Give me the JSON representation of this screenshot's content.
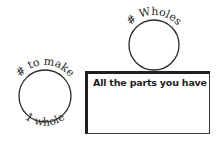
{
  "diagram": {
    "left_circle": {
      "top_label": "# to make",
      "bottom_label": "1 whole"
    },
    "top_circle": {
      "top_label": "# Wholes"
    },
    "box": {
      "label": "All the parts you have"
    }
  },
  "colors": {
    "stroke": "#2a2a2a",
    "background": "#ffffff"
  }
}
